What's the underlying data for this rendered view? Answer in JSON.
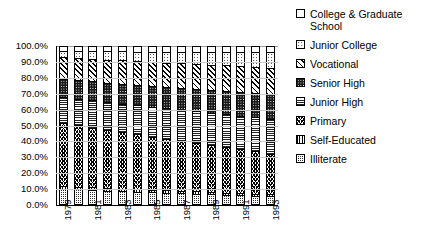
{
  "chart_data": {
    "type": "bar",
    "subtype": "stacked-percentage",
    "title": "",
    "xlabel": "",
    "ylabel": "",
    "ylim": [
      0,
      100
    ],
    "ytick_labels": [
      "100.0%",
      "90.0%",
      "80.0%",
      "70.0%",
      "60.0%",
      "50.0%",
      "40.0%",
      "30.0%",
      "20.0%",
      "10.0%",
      "0.0%"
    ],
    "ytick_values": [
      100,
      90,
      80,
      70,
      60,
      50,
      40,
      30,
      20,
      10,
      0
    ],
    "grid": true,
    "legend_position": "right",
    "categories": [
      "1979",
      "1980",
      "1981",
      "1982",
      "1983",
      "1984",
      "1985",
      "1986",
      "1987",
      "1988",
      "1989",
      "1990",
      "1991",
      "1992",
      "1993"
    ],
    "xtick_labels_shown": [
      "1979",
      "1981",
      "1983",
      "1985",
      "1987",
      "1989",
      "1991",
      "1993"
    ],
    "stack_order_bottom_to_top": [
      "Illiterate",
      "Self-Educated",
      "Primary",
      "Junior High",
      "Senior High",
      "Vocational",
      "Junior College",
      "College & Graduate School"
    ],
    "series": [
      {
        "name": "Illiterate",
        "values": [
          9.0,
          8.6,
          8.2,
          7.8,
          7.5,
          7.1,
          6.8,
          6.5,
          6.2,
          5.9,
          5.6,
          5.3,
          5.0,
          4.7,
          4.4
        ]
      },
      {
        "name": "Self-Educated",
        "values": [
          1.8,
          1.8,
          1.7,
          1.7,
          1.6,
          1.6,
          1.5,
          1.5,
          1.4,
          1.4,
          1.3,
          1.3,
          1.2,
          1.2,
          1.1
        ]
      },
      {
        "name": "Primary",
        "values": [
          40.0,
          39.0,
          38.0,
          37.0,
          36.0,
          35.0,
          34.0,
          33.0,
          32.0,
          31.0,
          30.0,
          29.0,
          28.0,
          27.0,
          26.0
        ]
      },
      {
        "name": "Junior High",
        "values": [
          16.5,
          17.0,
          17.4,
          17.8,
          18.2,
          18.6,
          19.0,
          19.4,
          19.8,
          20.2,
          20.6,
          21.0,
          21.4,
          21.8,
          22.2
        ]
      },
      {
        "name": "Senior High",
        "values": [
          11.5,
          11.8,
          12.1,
          12.4,
          12.7,
          13.0,
          13.3,
          13.6,
          13.9,
          14.2,
          14.5,
          14.8,
          15.1,
          15.4,
          15.7
        ]
      },
      {
        "name": "Vocational",
        "values": [
          14.0,
          14.2,
          14.4,
          14.6,
          14.8,
          15.0,
          15.2,
          15.4,
          15.6,
          15.8,
          16.0,
          16.2,
          16.4,
          16.6,
          16.8
        ]
      },
      {
        "name": "Junior College",
        "values": [
          4.2,
          4.5,
          4.9,
          5.3,
          5.7,
          6.1,
          6.5,
          6.9,
          7.3,
          7.7,
          8.1,
          8.5,
          8.9,
          9.3,
          9.7
        ]
      },
      {
        "name": "College & Graduate School",
        "values": [
          3.0,
          3.1,
          3.3,
          3.4,
          3.5,
          3.6,
          3.7,
          3.7,
          3.8,
          3.8,
          3.9,
          3.9,
          4.0,
          4.0,
          4.1
        ]
      }
    ]
  },
  "legend": {
    "items": [
      {
        "label": "College & Graduate School",
        "pattern": "diagonal-hatch"
      },
      {
        "label": "Junior College",
        "pattern": "dotted"
      },
      {
        "label": "Vocational",
        "pattern": "diagonal-stripe"
      },
      {
        "label": "Senior High",
        "pattern": "dark-speckle"
      },
      {
        "label": "Junior High",
        "pattern": "horizontal-lines"
      },
      {
        "label": "Primary",
        "pattern": "wave-scale"
      },
      {
        "label": "Self-Educated",
        "pattern": "vertical-lines"
      },
      {
        "label": "Illiterate",
        "pattern": "dark-checker"
      }
    ]
  },
  "colors": {
    "ink": "#000000",
    "grid": "#c9c9c9",
    "background": "#ffffff"
  }
}
